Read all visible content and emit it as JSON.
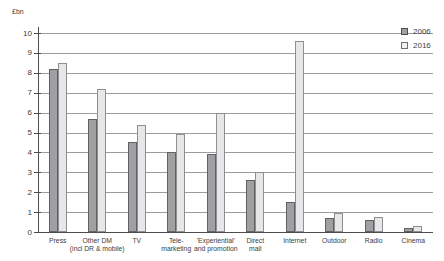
{
  "chart_data": {
    "type": "bar",
    "title": "",
    "ylabel": "£bn",
    "xlabel": "",
    "ylim": [
      0,
      10
    ],
    "yticks": [
      0,
      1,
      2,
      3,
      4,
      5,
      6,
      7,
      8,
      9,
      10
    ],
    "grid": "horizontal",
    "legend_position": "top-right",
    "categories": [
      "Press",
      "Other DM\n(incl DR & mobile)",
      "TV",
      "Tele-\nmarketing",
      "'Experiential'\nand promotion",
      "Direct\nmail",
      "Internet",
      "Outdoor",
      "Radio",
      "Cinema"
    ],
    "series": [
      {
        "name": "2006",
        "values": [
          8.2,
          5.7,
          4.5,
          4.0,
          3.9,
          2.6,
          1.5,
          0.7,
          0.6,
          0.2
        ],
        "fill": "#a0a0a2",
        "border": "#626264"
      },
      {
        "name": "2016",
        "values": [
          8.5,
          7.2,
          5.4,
          4.9,
          6.0,
          3.0,
          9.6,
          0.95,
          0.75,
          0.3
        ],
        "fill": "#e7e7e9",
        "border": "#8f8f91"
      }
    ],
    "colors": {
      "background": "#ffffff",
      "gridline": "#9d9d9d",
      "axis": "#4d4d4d",
      "text": "#3c3c3c"
    }
  }
}
